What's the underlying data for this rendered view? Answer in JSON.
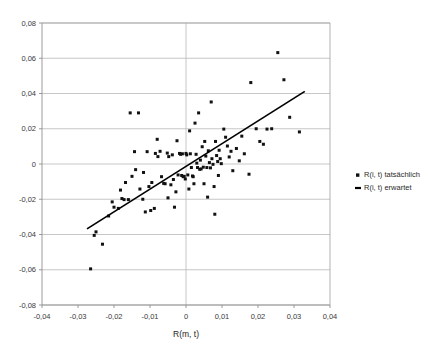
{
  "chart_data": {
    "type": "scatter",
    "title": "",
    "xlabel": "R(m, t)",
    "ylabel": "",
    "xlim": [
      -0.04,
      0.04
    ],
    "ylim": [
      -0.08,
      0.08
    ],
    "xticks": [
      -0.04,
      -0.03,
      -0.02,
      -0.01,
      0,
      0.01,
      0.02,
      0.03,
      0.04
    ],
    "yticks": [
      -0.08,
      -0.06,
      -0.04,
      -0.02,
      0,
      0.02,
      0.04,
      0.06,
      0.08
    ],
    "xtick_labels": [
      "-0,04",
      "-0,03",
      "-0,02",
      "-0,01",
      "0",
      "0,01",
      "0,02",
      "0,03",
      "0,04"
    ],
    "ytick_labels": [
      "-0,08",
      "-0,06",
      "-0,04",
      "-0,02",
      "0",
      "0,02",
      "0,04",
      "0,06",
      "0,08"
    ],
    "grid": "horizontal-and-vertical-at-zero",
    "legend_position": "right",
    "marker_color": "#111111",
    "line_color": "#000000",
    "grid_color": "#b9b9b9",
    "series": [
      {
        "name": "R(i, t) tatsächlich",
        "type": "scatter",
        "marker": "square",
        "points": [
          [
            -0.0265,
            -0.0595
          ],
          [
            -0.0255,
            -0.0405
          ],
          [
            -0.025,
            -0.0385
          ],
          [
            -0.0232,
            -0.0455
          ],
          [
            -0.0215,
            -0.0295
          ],
          [
            -0.0205,
            -0.0215
          ],
          [
            -0.02,
            -0.0245
          ],
          [
            -0.0188,
            -0.0252
          ],
          [
            -0.0182,
            -0.0148
          ],
          [
            -0.0178,
            -0.0196
          ],
          [
            -0.0172,
            -0.0202
          ],
          [
            -0.0168,
            -0.0105
          ],
          [
            -0.016,
            -0.0202
          ],
          [
            -0.0155,
            0.029
          ],
          [
            -0.015,
            -0.007
          ],
          [
            -0.0143,
            0.007
          ],
          [
            -0.014,
            -0.0032
          ],
          [
            -0.0132,
            0.029
          ],
          [
            -0.0128,
            -0.0142
          ],
          [
            -0.012,
            -0.02
          ],
          [
            -0.0118,
            -0.0048
          ],
          [
            -0.0113,
            -0.0272
          ],
          [
            -0.0108,
            0.007
          ],
          [
            -0.0103,
            -0.0128
          ],
          [
            -0.0098,
            -0.0264
          ],
          [
            -0.0095,
            -0.0105
          ],
          [
            -0.0088,
            -0.0252
          ],
          [
            -0.0085,
            0.006
          ],
          [
            -0.008,
            0.014
          ],
          [
            -0.0078,
            0.0042
          ],
          [
            -0.0072,
            0.0072
          ],
          [
            -0.0068,
            -0.0072
          ],
          [
            -0.0062,
            -0.011
          ],
          [
            -0.0058,
            -0.0112
          ],
          [
            -0.0052,
            0.0062
          ],
          [
            -0.005,
            -0.0192
          ],
          [
            -0.0048,
            0.0042
          ],
          [
            -0.0042,
            -0.0118
          ],
          [
            -0.0038,
            0.0052
          ],
          [
            -0.0035,
            -0.0088
          ],
          [
            -0.0032,
            -0.0245
          ],
          [
            -0.0028,
            -0.0158
          ],
          [
            -0.0025,
            0.0132
          ],
          [
            -0.0022,
            -0.0062
          ],
          [
            -0.0018,
            0.006
          ],
          [
            -0.0015,
            0.0055
          ],
          [
            -0.0012,
            -0.0065
          ],
          [
            -0.001,
            0.0058
          ],
          [
            -0.0008,
            -0.0072
          ],
          [
            -0.0005,
            -0.007
          ],
          [
            -0.0002,
            -0.0085
          ],
          [
            0.0,
            0.006
          ],
          [
            0.0002,
            0.0052
          ],
          [
            0.0005,
            -0.0062
          ],
          [
            0.0008,
            -0.0142
          ],
          [
            0.001,
            0.0188
          ],
          [
            0.0012,
            0.0058
          ],
          [
            0.0015,
            -0.002
          ],
          [
            0.0018,
            -0.0068
          ],
          [
            0.002,
            -0.0072
          ],
          [
            0.0022,
            -0.0112
          ],
          [
            0.0025,
            0.0232
          ],
          [
            0.0028,
            0.0055
          ],
          [
            0.003,
            0.0005
          ],
          [
            0.0032,
            -0.002
          ],
          [
            0.0035,
            0.029
          ],
          [
            0.0038,
            -0.003
          ],
          [
            0.004,
            0.0022
          ],
          [
            0.0042,
            -0.0028
          ],
          [
            0.0045,
            0.0098
          ],
          [
            0.0048,
            -0.0018
          ],
          [
            0.005,
            -0.0112
          ],
          [
            0.0052,
            0.0128
          ],
          [
            0.0055,
            0.0045
          ],
          [
            0.0058,
            -0.002
          ],
          [
            0.006,
            -0.0188
          ],
          [
            0.0062,
            0.0075
          ],
          [
            0.0065,
            0.0008
          ],
          [
            0.0068,
            -0.0022
          ],
          [
            0.007,
            0.0352
          ],
          [
            0.0072,
            0.003
          ],
          [
            0.0075,
            -0.0002
          ],
          [
            0.0078,
            -0.0128
          ],
          [
            0.008,
            -0.0285
          ],
          [
            0.0082,
            0.0128
          ],
          [
            0.0085,
            0.0048
          ],
          [
            0.0088,
            0.0014
          ],
          [
            0.009,
            -0.0065
          ],
          [
            0.0092,
            0.0078
          ],
          [
            0.0095,
            0.003
          ],
          [
            0.0098,
            0.0002
          ],
          [
            0.0105,
            0.0198
          ],
          [
            0.011,
            0.0152
          ],
          [
            0.0115,
            0.0102
          ],
          [
            0.012,
            0.004
          ],
          [
            0.0125,
            0.0072
          ],
          [
            0.013,
            -0.0038
          ],
          [
            0.014,
            0.0088
          ],
          [
            0.0148,
            0.0018
          ],
          [
            0.0155,
            0.0158
          ],
          [
            0.0162,
            0.0058
          ],
          [
            0.0175,
            -0.0058
          ],
          [
            0.018,
            0.0462
          ],
          [
            0.0195,
            0.02
          ],
          [
            0.0205,
            0.0128
          ],
          [
            0.0215,
            0.0112
          ],
          [
            0.0225,
            0.0198
          ],
          [
            0.0238,
            0.02
          ],
          [
            0.0255,
            0.0632
          ],
          [
            0.0272,
            0.0478
          ],
          [
            0.0288,
            0.0265
          ],
          [
            0.0315,
            0.0182
          ]
        ]
      },
      {
        "name": "R(i, t) erwartet",
        "type": "line",
        "endpoints": [
          [
            -0.0275,
            -0.0368
          ],
          [
            0.033,
            0.0412
          ]
        ],
        "slope": 1.289,
        "intercept": -0.0014
      }
    ],
    "legend_entries": [
      {
        "label": "R(i, t) tatsächlich",
        "marker": "square",
        "color": "#111111"
      },
      {
        "label": "R(i, t) erwartet",
        "marker": "line",
        "color": "#000000"
      }
    ]
  }
}
